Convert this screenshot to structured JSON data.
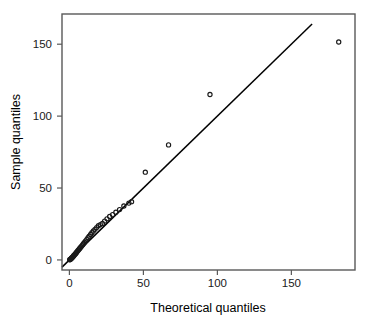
{
  "figure": {
    "background_color": "#ffffff",
    "frame_color": "#595959",
    "point_color": "#1a1a1a",
    "line_color": "#000000"
  },
  "chart_data": {
    "type": "scatter",
    "title": "",
    "xlabel": "Theoretical quantiles",
    "ylabel": "Sample quantiles",
    "xlim": [
      -5,
      193
    ],
    "ylim": [
      -7,
      171
    ],
    "xticks": [
      0,
      50,
      100,
      150
    ],
    "yticks": [
      0,
      50,
      100,
      150
    ],
    "xtick_labels": [
      "0",
      "50",
      "100",
      "150"
    ],
    "ytick_labels": [
      "0",
      "50",
      "100",
      "150"
    ],
    "grid": false,
    "legend": "none",
    "series": [
      {
        "name": "Q-Q points",
        "marker": "open-circle",
        "x": [
          0.2,
          0.5,
          0.8,
          1.1,
          1.4,
          1.7,
          2.0,
          2.3,
          2.6,
          2.9,
          3.2,
          3.6,
          4.0,
          4.4,
          4.8,
          5.2,
          5.7,
          6.2,
          6.7,
          7.2,
          7.8,
          8.4,
          9.0,
          9.6,
          10.3,
          11.0,
          11.8,
          12.6,
          13.4,
          14.3,
          15.2,
          16.2,
          17.3,
          18.4,
          19.6,
          20.9,
          22.3,
          23.8,
          25.4,
          27.2,
          29.2,
          31.4,
          33.9,
          36.8,
          40.2,
          42.0,
          51.3,
          67.0,
          95.0,
          182.0
        ],
        "y": [
          0.1,
          0.3,
          0.6,
          0.9,
          1.2,
          1.5,
          1.8,
          2.1,
          2.5,
          2.9,
          3.3,
          3.7,
          4.2,
          4.7,
          5.2,
          5.8,
          6.4,
          7.0,
          7.6,
          8.3,
          9.0,
          9.8,
          10.6,
          11.4,
          12.3,
          13.3,
          14.3,
          15.4,
          16.5,
          17.7,
          18.9,
          20.1,
          21.3,
          22.5,
          23.8,
          24.6,
          25.4,
          27.0,
          28.6,
          30.2,
          31.5,
          33.2,
          35.0,
          37.5,
          39.5,
          40.5,
          61.0,
          80.0,
          115.0,
          151.5
        ]
      }
    ],
    "reference_line": {
      "name": "identity-line",
      "slope": 1.0,
      "intercept": 0.0,
      "x_start": -5,
      "x_end": 164
    }
  },
  "axes": {
    "x": {
      "title": "Theoretical quantiles",
      "ticks": [
        {
          "value": 0,
          "label": "0"
        },
        {
          "value": 50,
          "label": "50"
        },
        {
          "value": 100,
          "label": "100"
        },
        {
          "value": 150,
          "label": "150"
        }
      ]
    },
    "y": {
      "title": "Sample quantiles",
      "ticks": [
        {
          "value": 0,
          "label": "0"
        },
        {
          "value": 50,
          "label": "50"
        },
        {
          "value": 100,
          "label": "100"
        },
        {
          "value": 150,
          "label": "150"
        }
      ]
    }
  }
}
